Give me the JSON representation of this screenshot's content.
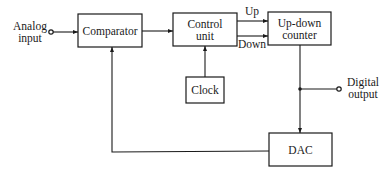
{
  "diagram": {
    "type": "block-diagram",
    "title": "",
    "blocks": {
      "comparator": {
        "label": "Comparator"
      },
      "control_unit": {
        "label_line1": "Control",
        "label_line2": "unit"
      },
      "counter": {
        "label_line1": "Up-down",
        "label_line2": "counter"
      },
      "clock": {
        "label": "Clock"
      },
      "dac": {
        "label": "DAC"
      }
    },
    "signals": {
      "analog_input_line1": "Analog",
      "analog_input_line2": "input",
      "up": "Up",
      "down": "Down",
      "digital_output_line1": "Digital",
      "digital_output_line2": "output"
    },
    "connections": [
      {
        "from": "analog_input",
        "to": "comparator"
      },
      {
        "from": "comparator",
        "to": "control_unit"
      },
      {
        "from": "clock",
        "to": "control_unit"
      },
      {
        "from": "control_unit",
        "to": "counter",
        "label": "Up"
      },
      {
        "from": "control_unit",
        "to": "counter",
        "label": "Down"
      },
      {
        "from": "counter",
        "to": "digital_output"
      },
      {
        "from": "counter",
        "to": "dac"
      },
      {
        "from": "dac",
        "to": "comparator"
      }
    ],
    "colors": {
      "stroke": "#1a1a1a",
      "background": "#ffffff"
    }
  }
}
